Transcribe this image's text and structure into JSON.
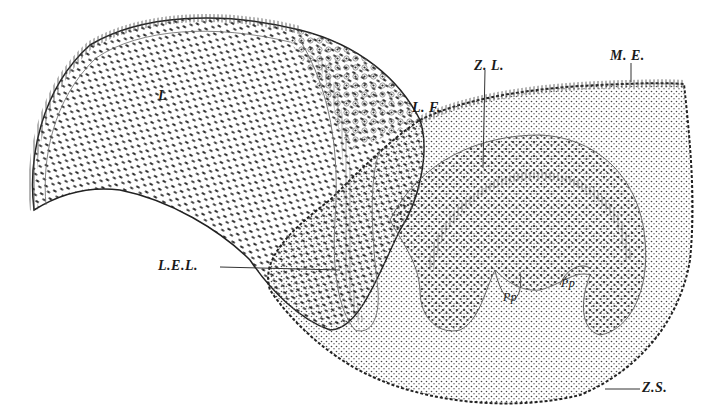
{
  "figure": {
    "colors": {
      "ink": "#1a1a1a",
      "paper": "#ffffff",
      "line": "#555555"
    },
    "labels": [
      {
        "id": "L",
        "text": "L",
        "x": 158,
        "y": 88
      },
      {
        "id": "LF",
        "text": "L. F.",
        "x": 412,
        "y": 100
      },
      {
        "id": "ZL",
        "text": "Z. L.",
        "x": 474,
        "y": 58
      },
      {
        "id": "ME",
        "text": "M. E.",
        "x": 610,
        "y": 48
      },
      {
        "id": "LEL",
        "text": "L.E.L.",
        "x": 158,
        "y": 256
      },
      {
        "id": "Pp1",
        "text": "Pp",
        "x": 503,
        "y": 290
      },
      {
        "id": "Pp2",
        "text": "Pp",
        "x": 561,
        "y": 276
      },
      {
        "id": "ZS",
        "text": "Z.S.",
        "x": 642,
        "y": 374
      }
    ]
  }
}
